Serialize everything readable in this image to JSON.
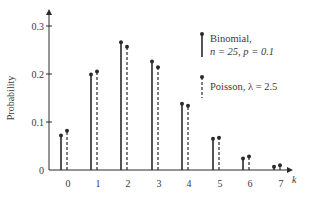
{
  "chart_data": {
    "type": "bar",
    "subtype": "stem",
    "title": "",
    "xlabel": "k",
    "ylabel": "Probability",
    "categories": [
      "0",
      "1",
      "2",
      "3",
      "4",
      "5",
      "6",
      "7"
    ],
    "yticks": [
      "0",
      "0.1",
      "0.2",
      "0.3"
    ],
    "ylim": [
      0,
      0.33
    ],
    "grid": false,
    "legend_position": "upper right",
    "series": [
      {
        "name": "Binomial, n = 25, p = 0.1",
        "legend_line1": "Binomial,",
        "legend_line2": "n = 25, p = 0.1",
        "style": "solid",
        "values": [
          0.072,
          0.199,
          0.266,
          0.226,
          0.138,
          0.065,
          0.024,
          0.007
        ]
      },
      {
        "name": "Poisson, λ = 2.5",
        "legend_line1": "Poisson, λ = 2.5",
        "style": "dashed",
        "values": [
          0.082,
          0.205,
          0.257,
          0.214,
          0.134,
          0.067,
          0.028,
          0.01
        ]
      }
    ],
    "colors": {
      "ink": "#2a2a2a",
      "text": "#3a3a3a",
      "background": "#ffffff"
    }
  }
}
